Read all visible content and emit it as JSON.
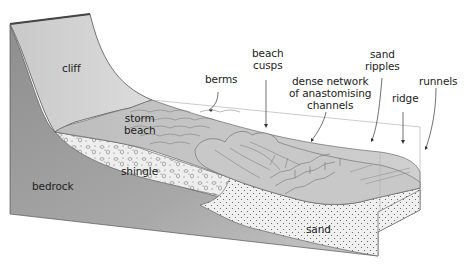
{
  "diagram": {
    "type": "block-diagram",
    "labels": {
      "cliff": "cliff",
      "berms": "berms",
      "beach_cusps_1": "beach",
      "beach_cusps_2": "cusps",
      "channels_1": "dense network",
      "channels_2": "of anastomising",
      "channels_3": "channels",
      "sand_ripples_1": "sand",
      "sand_ripples_2": "ripples",
      "ridge": "ridge",
      "runnels": "runnels",
      "storm_beach_1": "storm",
      "storm_beach_2": "beach",
      "shingle": "shingle",
      "bedrock": "bedrock",
      "sand": "sand"
    },
    "colors": {
      "bedrock": "#9a9a9a",
      "cliff": "#d4d4d4",
      "beach_surface": "#c4c4c4",
      "sand_layer": "#eeeeee",
      "outline": "#555555",
      "label_text": "#222222"
    }
  }
}
